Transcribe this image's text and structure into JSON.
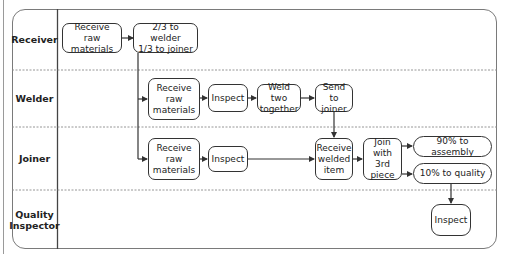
{
  "diagram": {
    "type": "swimlane-flowchart",
    "lanes": [
      {
        "id": "receiver",
        "label": "Receiver"
      },
      {
        "id": "welder",
        "label": "Welder"
      },
      {
        "id": "joiner",
        "label": "Joiner"
      },
      {
        "id": "quality",
        "label": "Quality Inspector"
      }
    ],
    "nodes": {
      "r_receive": {
        "lane": "receiver",
        "text": "Receive raw materials"
      },
      "r_split": {
        "lane": "receiver",
        "text": "2/3 to welder 1/3 to joiner"
      },
      "w_receive": {
        "lane": "welder",
        "text": "Receive raw materials"
      },
      "w_inspect": {
        "lane": "welder",
        "text": "Inspect"
      },
      "w_weld": {
        "lane": "welder",
        "text": "Weld two together"
      },
      "w_send": {
        "lane": "welder",
        "text": "Send to joiner"
      },
      "j_receive": {
        "lane": "joiner",
        "text": "Receive raw materials"
      },
      "j_inspect": {
        "lane": "joiner",
        "text": "Inspect"
      },
      "j_receive_welded": {
        "lane": "joiner",
        "text": "Receive welded item"
      },
      "j_join": {
        "lane": "joiner",
        "text": "Join with 3rd piece"
      },
      "j_assembly": {
        "lane": "joiner",
        "text": "90% to assembly"
      },
      "j_quality": {
        "lane": "joiner",
        "text": "10% to quality"
      },
      "q_inspect": {
        "lane": "quality",
        "text": "Inspect"
      }
    },
    "edges": [
      [
        "r_receive",
        "r_split"
      ],
      [
        "r_split",
        "w_receive"
      ],
      [
        "r_split",
        "j_receive"
      ],
      [
        "w_receive",
        "w_inspect"
      ],
      [
        "w_inspect",
        "w_weld"
      ],
      [
        "w_weld",
        "w_send"
      ],
      [
        "w_send",
        "j_receive_welded"
      ],
      [
        "j_receive",
        "j_inspect"
      ],
      [
        "j_inspect",
        "j_receive_welded"
      ],
      [
        "j_receive_welded",
        "j_join"
      ],
      [
        "j_join",
        "j_assembly"
      ],
      [
        "j_join",
        "j_quality"
      ],
      [
        "j_quality",
        "q_inspect"
      ]
    ]
  },
  "labels": {
    "receiver": "Receiver",
    "welder": "Welder",
    "joiner": "Joiner",
    "quality_line1": "Quality",
    "quality_line2": "Inspector",
    "r_receive_1": "Receive raw",
    "r_receive_2": "materials",
    "r_split_1": "2/3 to welder",
    "r_split_2": "1/3 to joiner",
    "w_receive_1": "Receive",
    "w_receive_2": "raw",
    "w_receive_3": "materials",
    "w_inspect": "Inspect",
    "w_weld_1": "Weld two",
    "w_weld_2": "together",
    "w_send_1": "Send to",
    "w_send_2": "joiner",
    "j_receive_1": "Receive",
    "j_receive_2": "raw",
    "j_receive_3": "materials",
    "j_inspect": "Inspect",
    "j_rw_1": "Receive",
    "j_rw_2": "welded",
    "j_rw_3": "item",
    "j_join_1": "Join",
    "j_join_2": "with 3rd",
    "j_join_3": "piece",
    "j_assembly": "90% to assembly",
    "j_quality": "10% to quality",
    "q_inspect": "Inspect"
  },
  "colors": {
    "line": "#333333",
    "frame": "#7a7a7a",
    "divider": "#8a8a8a"
  }
}
